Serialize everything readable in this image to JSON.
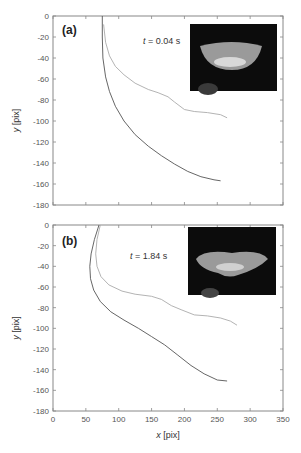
{
  "figure": {
    "xlabel": "x [pix]",
    "ylabel": "y [pix]"
  },
  "chart_data": [
    {
      "type": "line",
      "panel_label": "(a)",
      "annotation": "t = 0.04 s",
      "xlabel": "x [pix]",
      "ylabel": "y [pix]",
      "xlim": [
        0,
        350
      ],
      "ylim": [
        -180,
        0
      ],
      "xticks": [
        0,
        50,
        100,
        150,
        200,
        250,
        300,
        350
      ],
      "yticks": [
        0,
        -20,
        -40,
        -60,
        -80,
        -100,
        -120,
        -140,
        -160,
        -180
      ],
      "ytick_labels": [
        "0",
        "-20",
        "-40",
        "-60",
        "-80",
        "-100",
        "-120",
        "-140",
        "-160",
        "-180"
      ],
      "grid": false,
      "inset": "jellyfish photo (dark background)",
      "series": [
        {
          "name": "outer trajectory",
          "color": "#555555",
          "x": [
            75,
            75,
            76,
            80,
            86,
            95,
            108,
            125,
            145,
            165,
            185,
            205,
            225,
            245,
            255
          ],
          "y": [
            0,
            -20,
            -40,
            -58,
            -72,
            -86,
            -100,
            -113,
            -124,
            -133,
            -141,
            -148,
            -153,
            -156,
            -157
          ]
        },
        {
          "name": "inner trajectory",
          "color": "#aaaaaa",
          "x": [
            77,
            80,
            86,
            95,
            108,
            125,
            145,
            160,
            175,
            185,
            200,
            215,
            235,
            255,
            265
          ],
          "y": [
            -8,
            -25,
            -38,
            -48,
            -56,
            -64,
            -70,
            -73,
            -77,
            -82,
            -89,
            -91,
            -92,
            -94,
            -97
          ]
        }
      ]
    },
    {
      "type": "line",
      "panel_label": "(b)",
      "annotation": "t = 1.84 s",
      "xlabel": "x [pix]",
      "ylabel": "y [pix]",
      "xlim": [
        0,
        350
      ],
      "ylim": [
        -180,
        0
      ],
      "xticks": [
        0,
        50,
        100,
        150,
        200,
        250,
        300,
        350
      ],
      "xtick_labels": [
        "0",
        "50",
        "100",
        "150",
        "200",
        "250",
        "300",
        "350"
      ],
      "yticks": [
        0,
        -20,
        -40,
        -60,
        -80,
        -100,
        -120,
        -140,
        -160,
        -180
      ],
      "ytick_labels": [
        "0",
        "-20",
        "-40",
        "-60",
        "-80",
        "-100",
        "-120",
        "-140",
        "-160",
        "-180"
      ],
      "grid": false,
      "inset": "jellyfish photo (dark background)",
      "series": [
        {
          "name": "outer trajectory",
          "color": "#555555",
          "x": [
            70,
            63,
            58,
            56,
            57,
            62,
            72,
            88,
            108,
            130,
            150,
            170,
            190,
            210,
            230,
            250,
            265
          ],
          "y": [
            0,
            -14,
            -28,
            -40,
            -52,
            -63,
            -74,
            -84,
            -92,
            -100,
            -108,
            -116,
            -126,
            -136,
            -144,
            -150,
            -151
          ]
        },
        {
          "name": "inner trajectory",
          "color": "#aaaaaa",
          "x": [
            72,
            67,
            65,
            67,
            73,
            85,
            105,
            125,
            150,
            165,
            180,
            195,
            215,
            235,
            255,
            270,
            280
          ],
          "y": [
            0,
            -14,
            -28,
            -40,
            -50,
            -58,
            -64,
            -67,
            -69,
            -72,
            -78,
            -82,
            -87,
            -88,
            -90,
            -93,
            -97
          ]
        }
      ]
    }
  ]
}
